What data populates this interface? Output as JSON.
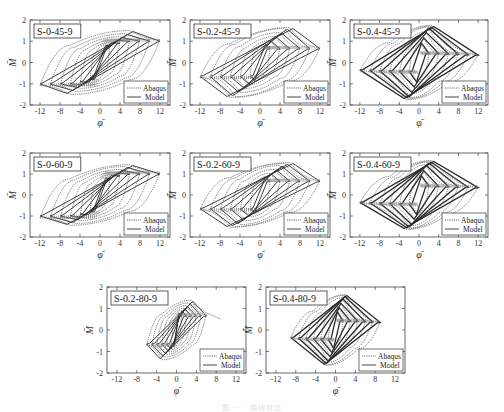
{
  "figure": {
    "caption": "图 · · · 曲线对比",
    "legend_labels": [
      "Abaqus",
      "Model"
    ],
    "x_axis_label": "φ̄",
    "y_axis_label": "M̄"
  },
  "chart_data": [
    {
      "type": "line",
      "title": "S-0-45-9",
      "xlabel": "φ̄",
      "ylabel": "M̄",
      "xlim": [
        -14,
        14
      ],
      "ylim": [
        -2,
        2
      ],
      "xticks": [
        -12,
        -8,
        -4,
        0,
        4,
        8,
        12
      ],
      "yticks": [
        -2,
        -1,
        0,
        1,
        2
      ],
      "legend": [
        "Abaqus",
        "Model"
      ],
      "legend_position": "lower right",
      "grid": false,
      "amplitudes": [
        2,
        4,
        6,
        8,
        10,
        12
      ],
      "peak_moment": 1.5,
      "slant": 0.55,
      "loop_style": "wide"
    },
    {
      "type": "line",
      "title": "S-0.2-45-9",
      "xlabel": "φ̄",
      "ylabel": "M̄",
      "xlim": [
        -14,
        14
      ],
      "ylim": [
        -2,
        2
      ],
      "xticks": [
        -12,
        -8,
        -4,
        0,
        4,
        8,
        12
      ],
      "yticks": [
        -2,
        -1,
        0,
        1,
        2
      ],
      "legend": [
        "Abaqus",
        "Model"
      ],
      "legend_position": "lower right",
      "grid": false,
      "amplitudes": [
        2,
        4,
        6,
        8,
        10,
        12
      ],
      "peak_moment": 1.6,
      "slant": 0.8,
      "loop_style": "pinched"
    },
    {
      "type": "line",
      "title": "S-0.4-45-9",
      "xlabel": "φ̄",
      "ylabel": "M̄",
      "xlim": [
        -14,
        14
      ],
      "ylim": [
        -2,
        2
      ],
      "xticks": [
        -12,
        -8,
        -4,
        0,
        4,
        8,
        12
      ],
      "yticks": [
        -2,
        -1,
        0,
        1,
        2
      ],
      "legend": [
        "Abaqus",
        "Model"
      ],
      "legend_position": "lower right",
      "grid": false,
      "amplitudes": [
        2,
        4,
        6,
        8,
        10,
        12
      ],
      "peak_moment": 1.7,
      "slant": 1.2,
      "loop_style": "narrow"
    },
    {
      "type": "line",
      "title": "S-0-60-9",
      "xlabel": "φ̄",
      "ylabel": "M̄",
      "xlim": [
        -14,
        14
      ],
      "ylim": [
        -2,
        2
      ],
      "xticks": [
        -12,
        -8,
        -4,
        0,
        4,
        8,
        12
      ],
      "yticks": [
        -2,
        -1,
        0,
        1,
        2
      ],
      "legend": [
        "Abaqus",
        "Model"
      ],
      "legend_position": "lower right",
      "grid": false,
      "amplitudes": [
        2,
        4,
        6,
        8,
        10,
        12
      ],
      "peak_moment": 1.4,
      "slant": 0.55,
      "loop_style": "wide"
    },
    {
      "type": "line",
      "title": "S-0.2-60-9",
      "xlabel": "φ̄",
      "ylabel": "M̄",
      "xlim": [
        -14,
        14
      ],
      "ylim": [
        -2,
        2
      ],
      "xticks": [
        -12,
        -8,
        -4,
        0,
        4,
        8,
        12
      ],
      "yticks": [
        -2,
        -1,
        0,
        1,
        2
      ],
      "legend": [
        "Abaqus",
        "Model"
      ],
      "legend_position": "lower right",
      "grid": false,
      "amplitudes": [
        2,
        4,
        6,
        8,
        10,
        12
      ],
      "peak_moment": 1.5,
      "slant": 0.8,
      "loop_style": "pinched"
    },
    {
      "type": "line",
      "title": "S-0.4-60-9",
      "xlabel": "φ̄",
      "ylabel": "M̄",
      "xlim": [
        -14,
        14
      ],
      "ylim": [
        -2,
        2
      ],
      "xticks": [
        -12,
        -8,
        -4,
        0,
        4,
        8,
        12
      ],
      "yticks": [
        -2,
        -1,
        0,
        1,
        2
      ],
      "legend": [
        "Abaqus",
        "Model"
      ],
      "legend_position": "lower right",
      "grid": false,
      "amplitudes": [
        2,
        4,
        6,
        8,
        10,
        12
      ],
      "peak_moment": 1.6,
      "slant": 1.2,
      "loop_style": "narrow"
    },
    {
      "type": "line",
      "title": "S-0.2-80-9",
      "xlabel": "φ̄",
      "ylabel": "M̄",
      "xlim": [
        -14,
        14
      ],
      "ylim": [
        -2,
        2
      ],
      "xticks": [
        -12,
        -8,
        -4,
        0,
        4,
        8,
        12
      ],
      "yticks": [
        -2,
        -1,
        0,
        1,
        2
      ],
      "legend": [
        "Abaqus",
        "Model"
      ],
      "legend_position": "lower right",
      "grid": false,
      "amplitudes": [
        1,
        2,
        3,
        4,
        5,
        6
      ],
      "peak_moment": 1.5,
      "slant": 0.9,
      "loop_style": "pinched",
      "abaqus_tail": [
        [
          3.5,
          1.2
        ],
        [
          6,
          0.8
        ],
        [
          9,
          0.5
        ]
      ]
    },
    {
      "type": "line",
      "title": "S-0.4-80-9",
      "xlabel": "φ̄",
      "ylabel": "M̄",
      "xlim": [
        -14,
        14
      ],
      "ylim": [
        -2,
        2
      ],
      "xticks": [
        -12,
        -8,
        -4,
        0,
        4,
        8,
        12
      ],
      "yticks": [
        -2,
        -1,
        0,
        1,
        2
      ],
      "legend": [
        "Abaqus",
        "Model"
      ],
      "legend_position": "lower right",
      "grid": false,
      "amplitudes": [
        1.5,
        3,
        4.5,
        6,
        7.5,
        9
      ],
      "peak_moment": 1.6,
      "slant": 1.2,
      "loop_style": "narrow"
    }
  ],
  "layout": [
    {
      "left": 30,
      "top": 20,
      "width": 140,
      "height": 85
    },
    {
      "left": 190,
      "top": 20,
      "width": 140,
      "height": 85
    },
    {
      "left": 350,
      "top": 20,
      "width": 138,
      "height": 85
    },
    {
      "left": 30,
      "top": 153,
      "width": 140,
      "height": 84
    },
    {
      "left": 190,
      "top": 153,
      "width": 140,
      "height": 84
    },
    {
      "left": 350,
      "top": 153,
      "width": 138,
      "height": 84
    },
    {
      "left": 107,
      "top": 287,
      "width": 139,
      "height": 86
    },
    {
      "left": 266,
      "top": 287,
      "width": 139,
      "height": 86
    }
  ]
}
